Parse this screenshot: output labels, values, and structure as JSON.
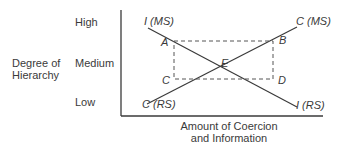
{
  "y_axis": {
    "title_line1": "Degree of",
    "title_line2": "Hierarchy",
    "ticks": [
      "High",
      "Medium",
      "Low"
    ]
  },
  "x_axis": {
    "title_line1": "Amount of Coercion",
    "title_line2": "and Information"
  },
  "lines": {
    "i_line": {
      "start_label": "I (MS)",
      "end_label": "I (RS)"
    },
    "c_line": {
      "start_label": "C (RS)",
      "end_label": "C (MS)"
    }
  },
  "points": {
    "a": "A",
    "b": "B",
    "c": "C",
    "d": "D",
    "e": "E"
  },
  "colors": {
    "line": "#3a3a3a",
    "dashed": "#555555"
  }
}
